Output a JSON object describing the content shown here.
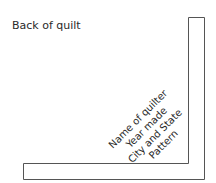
{
  "diagram": {
    "title": "Back of quilt",
    "label_lines": [
      "Name of quilter",
      "Year made",
      "City and State",
      "Pattern"
    ],
    "stroke_color": "#555555"
  }
}
